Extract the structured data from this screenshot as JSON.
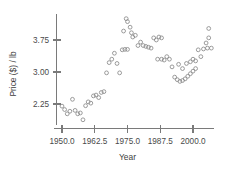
{
  "chart_data": {
    "type": "scatter",
    "title": "",
    "xlabel": "Year",
    "ylabel": "Price ($) / lb",
    "xlim": [
      1947.0,
      2008.0
    ],
    "ylim": [
      1.75,
      4.35
    ],
    "grid": false,
    "legend": null,
    "xticks": [
      1950.0,
      1962.5,
      1975.0,
      1987.5,
      2000.0
    ],
    "xtick_labels": [
      "1950.0",
      "1962.5",
      "1975.0",
      "1987.5",
      "2000.0"
    ],
    "yticks": [
      2.25,
      3.0,
      3.75
    ],
    "ytick_labels": [
      "2.25",
      "3.00",
      "3.75"
    ],
    "marker": "open-circle",
    "marker_color": "#8a8a8a",
    "points": [
      {
        "x": 1950.0,
        "y": 2.2
      },
      {
        "x": 1951.0,
        "y": 2.12
      },
      {
        "x": 1952.0,
        "y": 2.02
      },
      {
        "x": 1953.0,
        "y": 2.08
      },
      {
        "x": 1954.0,
        "y": 2.36
      },
      {
        "x": 1955.0,
        "y": 2.1
      },
      {
        "x": 1956.0,
        "y": 2.02
      },
      {
        "x": 1957.0,
        "y": 2.04
      },
      {
        "x": 1958.0,
        "y": 1.88
      },
      {
        "x": 1959.0,
        "y": 2.21
      },
      {
        "x": 1960.0,
        "y": 2.3
      },
      {
        "x": 1961.0,
        "y": 2.27
      },
      {
        "x": 1962.0,
        "y": 2.44
      },
      {
        "x": 1963.0,
        "y": 2.46
      },
      {
        "x": 1964.0,
        "y": 2.4
      },
      {
        "x": 1965.0,
        "y": 2.52
      },
      {
        "x": 1966.0,
        "y": 2.54
      },
      {
        "x": 1967.0,
        "y": 2.98
      },
      {
        "x": 1968.0,
        "y": 3.22
      },
      {
        "x": 1969.0,
        "y": 3.3
      },
      {
        "x": 1970.0,
        "y": 3.44
      },
      {
        "x": 1971.0,
        "y": 3.2
      },
      {
        "x": 1972.0,
        "y": 2.98
      },
      {
        "x": 1973.0,
        "y": 3.52
      },
      {
        "x": 1974.0,
        "y": 3.53
      },
      {
        "x": 1975.0,
        "y": 3.53
      },
      {
        "x": 1973.5,
        "y": 3.96
      },
      {
        "x": 1974.5,
        "y": 4.25
      },
      {
        "x": 1975.0,
        "y": 4.18
      },
      {
        "x": 1976.0,
        "y": 4.05
      },
      {
        "x": 1976.5,
        "y": 3.92
      },
      {
        "x": 1977.0,
        "y": 3.82
      },
      {
        "x": 1978.0,
        "y": 3.86
      },
      {
        "x": 1979.0,
        "y": 3.62
      },
      {
        "x": 1980.0,
        "y": 3.7
      },
      {
        "x": 1981.0,
        "y": 3.62
      },
      {
        "x": 1982.0,
        "y": 3.6
      },
      {
        "x": 1983.0,
        "y": 3.58
      },
      {
        "x": 1984.0,
        "y": 3.56
      },
      {
        "x": 1985.0,
        "y": 3.8
      },
      {
        "x": 1986.0,
        "y": 3.75
      },
      {
        "x": 1987.0,
        "y": 3.82
      },
      {
        "x": 1988.0,
        "y": 3.8
      },
      {
        "x": 1986.5,
        "y": 3.3
      },
      {
        "x": 1988.0,
        "y": 3.3
      },
      {
        "x": 1989.0,
        "y": 3.28
      },
      {
        "x": 1990.0,
        "y": 3.36
      },
      {
        "x": 1991.0,
        "y": 3.3
      },
      {
        "x": 1992.0,
        "y": 3.12
      },
      {
        "x": 1993.0,
        "y": 2.88
      },
      {
        "x": 1994.0,
        "y": 2.82
      },
      {
        "x": 1995.0,
        "y": 2.78
      },
      {
        "x": 1996.0,
        "y": 2.8
      },
      {
        "x": 1997.0,
        "y": 2.84
      },
      {
        "x": 1998.0,
        "y": 2.9
      },
      {
        "x": 1999.0,
        "y": 2.96
      },
      {
        "x": 2000.0,
        "y": 3.02
      },
      {
        "x": 2001.0,
        "y": 3.08
      },
      {
        "x": 1994.5,
        "y": 3.18
      },
      {
        "x": 1996.0,
        "y": 3.08
      },
      {
        "x": 1997.5,
        "y": 3.2
      },
      {
        "x": 1999.0,
        "y": 3.24
      },
      {
        "x": 2000.0,
        "y": 3.3
      },
      {
        "x": 2001.0,
        "y": 3.26
      },
      {
        "x": 2002.0,
        "y": 3.52
      },
      {
        "x": 2003.0,
        "y": 3.36
      },
      {
        "x": 2004.0,
        "y": 3.54
      },
      {
        "x": 2005.0,
        "y": 3.68
      },
      {
        "x": 2005.5,
        "y": 3.56
      },
      {
        "x": 2006.0,
        "y": 3.8
      },
      {
        "x": 2007.0,
        "y": 3.56
      },
      {
        "x": 2006.0,
        "y": 4.02
      }
    ]
  }
}
